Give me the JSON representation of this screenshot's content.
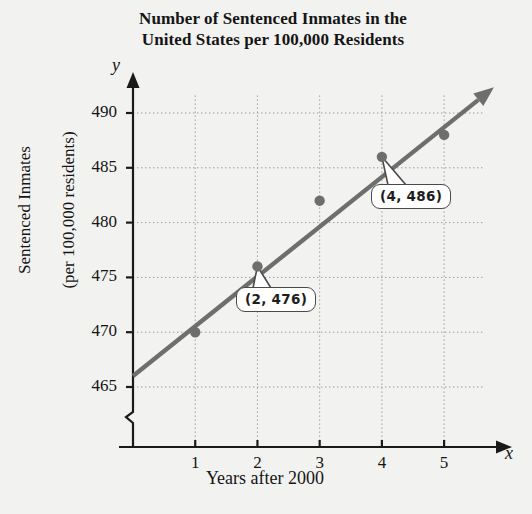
{
  "chart_data": {
    "type": "scatter",
    "title": "Number of Sentenced Inmates in the United States per 100,000 Residents",
    "title_line1": "Number of Sentenced Inmates in the",
    "title_line2": "United States per 100,000 Residents",
    "xlabel": "Years after 2000",
    "ylabel": "Sentenced Inmates\n(per 100,000 residents)",
    "ylabel_line1": "Sentenced Inmates",
    "ylabel_line2": "(per 100,000 residents)",
    "x_axis_letter": "x",
    "y_axis_letter": "y",
    "x": [
      1,
      2,
      3,
      4,
      5
    ],
    "values": [
      470,
      476,
      482,
      486,
      488
    ],
    "xticks": [
      "1",
      "2",
      "3",
      "4",
      "5"
    ],
    "yticks": [
      "465",
      "470",
      "475",
      "480",
      "485",
      "490"
    ],
    "ytick_values": [
      465,
      470,
      475,
      480,
      485,
      490
    ],
    "xlim": [
      0,
      5.85
    ],
    "ylim": [
      463.2,
      491.8
    ],
    "grid": true,
    "y_axis_break": true,
    "legend": "none",
    "trendline": {
      "type": "line",
      "x_start": 0,
      "y_start": 466,
      "x_end": 5.55,
      "y_end": 491.2,
      "arrow_end": true,
      "color": "#6e6e6e"
    },
    "annotations": [
      {
        "label": "(2, 476)",
        "point_x": 2,
        "point_y": 476
      },
      {
        "label": "(4, 486)",
        "point_x": 4,
        "point_y": 486
      }
    ],
    "colors": {
      "point": "#6e6e6e",
      "line": "#6e6e6e",
      "axis": "#1a1a1a",
      "grid": "#9a9a9a",
      "background": "#f2f2f0",
      "callout_fill": "#ffffff",
      "callout_border": "#4a4a4a"
    }
  }
}
